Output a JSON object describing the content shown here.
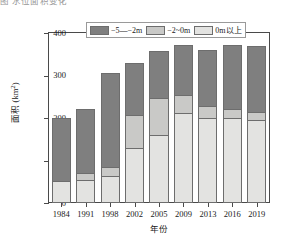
{
  "caption": {
    "clipped_text": "图  水位面积变化"
  },
  "chart_data": {
    "type": "bar",
    "stacked": true,
    "title": "",
    "xlabel": "年份",
    "ylabel": "面积 (km²)",
    "ylabel_main": "面积 (km",
    "ylabel_sup": "2",
    "ylabel_tail": ")",
    "categories": [
      "1984",
      "1991",
      "1998",
      "2002",
      "2005",
      "2009",
      "2013",
      "2016",
      "2019"
    ],
    "ylim": [
      0,
      400
    ],
    "yticks": [
      0,
      100,
      200,
      300,
      400
    ],
    "ytick_labels": [
      "0",
      "100",
      "200",
      "300",
      "400"
    ],
    "grid": false,
    "legend_position": "top-center",
    "series": [
      {
        "name": "0m以上",
        "color": "#e3e3e1",
        "values": [
          52,
          54,
          63,
          129,
          159,
          211,
          201,
          201,
          196
        ]
      },
      {
        "name": "−2~0m",
        "color": "#c9c9c7",
        "values": [
          0,
          16,
          21,
          77,
          89,
          42,
          28,
          21,
          17
        ]
      },
      {
        "name": "−5—−2m",
        "color": "#7f7f7f",
        "values": [
          147,
          152,
          222,
          124,
          110,
          119,
          131,
          150,
          157
        ]
      }
    ],
    "totals": [
      199,
      222,
      306,
      330,
      358,
      372,
      360,
      372,
      370
    ]
  },
  "legend": {
    "items": [
      {
        "label": "−5—−2m",
        "color": "#7f7f7f"
      },
      {
        "label": "−2~0m",
        "color": "#c9c9c7"
      },
      {
        "label": "0m以上",
        "color": "#e3e3e1"
      }
    ]
  },
  "colors": {
    "axis": "#4a4a4a",
    "bar_outline": "#6d6d6d",
    "background": "#ffffff"
  }
}
